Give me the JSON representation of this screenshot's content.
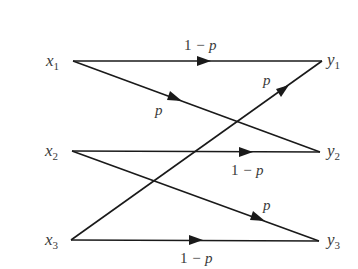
{
  "diagram": {
    "type": "channel-transition-diagram",
    "inputs": [
      {
        "id": "x1",
        "base": "x",
        "sub": "1",
        "pos": [
          73,
          61
        ]
      },
      {
        "id": "x2",
        "base": "x",
        "sub": "2",
        "pos": [
          72,
          151
        ]
      },
      {
        "id": "x3",
        "base": "x",
        "sub": "3",
        "pos": [
          71,
          240
        ]
      }
    ],
    "outputs": [
      {
        "id": "y1",
        "base": "y",
        "sub": "1",
        "pos": [
          322,
          61
        ]
      },
      {
        "id": "y2",
        "base": "y",
        "sub": "2",
        "pos": [
          320,
          152
        ]
      },
      {
        "id": "y3",
        "base": "y",
        "sub": "3",
        "pos": [
          319,
          241
        ]
      }
    ],
    "edges": [
      {
        "from": "x1",
        "to": "y1",
        "label_num": "1",
        "label_rest": " − p",
        "label": "1 − p"
      },
      {
        "from": "x1",
        "to": "y2",
        "label_num": "",
        "label_rest": "p",
        "label": "p"
      },
      {
        "from": "x2",
        "to": "y2",
        "label_num": "1",
        "label_rest": " − p",
        "label": "1 − p"
      },
      {
        "from": "x2",
        "to": "y3",
        "label_num": "",
        "label_rest": "p",
        "label": "p"
      },
      {
        "from": "x3",
        "to": "y3",
        "label_num": "1",
        "label_rest": " − p",
        "label": "1 − p"
      },
      {
        "from": "x3",
        "to": "y1",
        "label_num": "",
        "label_rest": "p",
        "label": "p"
      }
    ],
    "colors": {
      "line": "#1a1a1a",
      "text": "#3a3a3a",
      "background": "#ffffff"
    }
  }
}
